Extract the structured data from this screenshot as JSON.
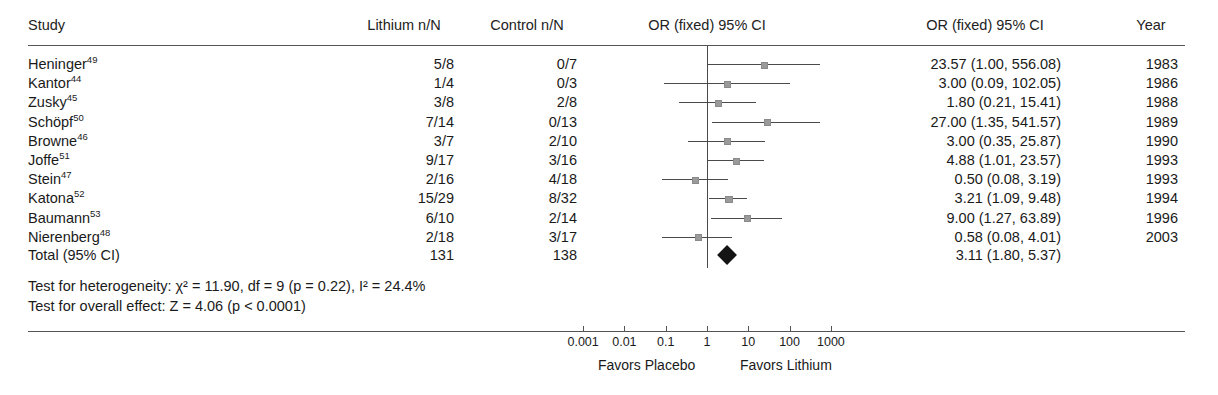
{
  "figure": {
    "type": "forest-plot",
    "columns": {
      "study": "Study",
      "treatment": "Lithium n/N",
      "control": "Control n/N",
      "plot": "OR (fixed) 95% CI",
      "estimate": "OR (fixed) 95% CI",
      "year": "Year"
    }
  },
  "chart_data": {
    "type": "forest",
    "title": "",
    "xlabel": "",
    "ylabel": "",
    "effect_measure": "OR (fixed) 95% CI",
    "scale": "log",
    "xlim": [
      0.001,
      1000
    ],
    "null_value": 1,
    "grid": false,
    "tick_labels": [
      "0.001",
      "0.01",
      "0.1",
      "1",
      "10",
      "100",
      "1000"
    ],
    "tick_values": [
      0.001,
      0.01,
      0.1,
      1,
      10,
      100,
      1000
    ],
    "left_label": "Favors Placebo",
    "right_label": "Favors Lithium",
    "rows": [
      {
        "study": "Heninger",
        "ref": "49",
        "treatment": "5/8",
        "control": "0/7",
        "or": 23.57,
        "lcl": 1.0,
        "ucl": 556.08,
        "text": "23.57 (1.00, 556.08)",
        "year": "1983",
        "weight": 4.0
      },
      {
        "study": "Kantor",
        "ref": "44",
        "treatment": "1/4",
        "control": "0/3",
        "or": 3.0,
        "lcl": 0.09,
        "ucl": 102.05,
        "text": "3.00 (0.09, 102.05)",
        "year": "1986",
        "weight": 3.3
      },
      {
        "study": "Zusky",
        "ref": "45",
        "treatment": "3/8",
        "control": "2/8",
        "or": 1.8,
        "lcl": 0.21,
        "ucl": 15.41,
        "text": "1.80 (0.21, 15.41)",
        "year": "1988",
        "weight": 4.6
      },
      {
        "study": "Schöpf",
        "ref": "50",
        "treatment": "7/14",
        "control": "0/13",
        "or": 27.0,
        "lcl": 1.35,
        "ucl": 541.57,
        "text": "27.00 (1.35, 541.57)",
        "year": "1989",
        "weight": 4.2
      },
      {
        "study": "Browne",
        "ref": "46",
        "treatment": "3/7",
        "control": "2/10",
        "or": 3.0,
        "lcl": 0.35,
        "ucl": 25.87,
        "text": "3.00 (0.35, 25.87)",
        "year": "1990",
        "weight": 4.6
      },
      {
        "study": "Joffe",
        "ref": "51",
        "treatment": "9/17",
        "control": "3/16",
        "or": 4.88,
        "lcl": 1.01,
        "ucl": 23.57,
        "text": "4.88 (1.01, 23.57)",
        "year": "1993",
        "weight": 6.0
      },
      {
        "study": "Stein",
        "ref": "47",
        "treatment": "2/16",
        "control": "4/18",
        "or": 0.5,
        "lcl": 0.08,
        "ucl": 3.19,
        "text": "0.50 (0.08, 3.19)",
        "year": "1993",
        "weight": 5.4
      },
      {
        "study": "Katona",
        "ref": "52",
        "treatment": "15/29",
        "control": "8/32",
        "or": 3.21,
        "lcl": 1.09,
        "ucl": 9.48,
        "text": "3.21 (1.09, 9.48)",
        "year": "1994",
        "weight": 7.4
      },
      {
        "study": "Baumann",
        "ref": "53",
        "treatment": "6/10",
        "control": "2/14",
        "or": 9.0,
        "lcl": 1.27,
        "ucl": 63.89,
        "text": "9.00 (1.27, 63.89)",
        "year": "1996",
        "weight": 5.0
      },
      {
        "study": "Nierenberg",
        "ref": "48",
        "treatment": "2/18",
        "control": "3/17",
        "or": 0.58,
        "lcl": 0.08,
        "ucl": 4.01,
        "text": "0.58 (0.08, 4.01)",
        "year": "2003",
        "weight": 5.2
      }
    ],
    "total": {
      "label": "Total (95% CI)",
      "treatment": "131",
      "control": "138",
      "or": 3.11,
      "lcl": 1.8,
      "ucl": 5.37,
      "text": "3.11 (1.80, 5.37)",
      "year": ""
    },
    "statistics": {
      "heterogeneity": "Test for heterogeneity: χ² = 11.90, df = 9 (p = 0.22), I² = 24.4%",
      "overall_effect": "Test for overall effect: Z = 4.06 (p < 0.0001)",
      "heterogeneity_chi2": 11.9,
      "heterogeneity_df": 9,
      "heterogeneity_p": "0.22",
      "i_squared": "24.4%",
      "overall_z": 4.06,
      "overall_p": "< 0.0001"
    }
  }
}
